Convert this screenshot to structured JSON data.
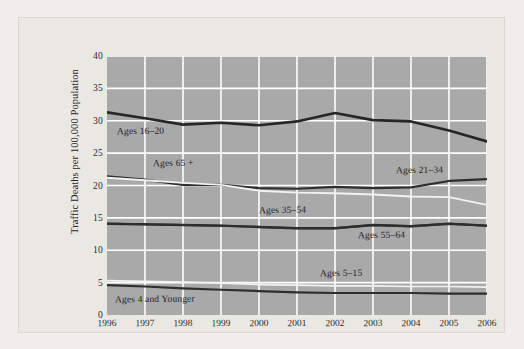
{
  "chart_data": {
    "type": "line",
    "title": "",
    "xlabel": "",
    "ylabel": "Traffic Deaths per 100,000 Population",
    "categories": [
      1996,
      1997,
      1998,
      1999,
      2000,
      2001,
      2002,
      2003,
      2004,
      2005,
      2006
    ],
    "x_tick_labels": [
      "1996",
      "1997",
      "1998",
      "1999",
      "2000",
      "2001",
      "2002",
      "2003",
      "2004",
      "2005",
      "2006"
    ],
    "y_tick_labels": [
      "0",
      "5",
      "10",
      "15",
      "20",
      "25",
      "30",
      "35",
      "40"
    ],
    "y_ticks": [
      0,
      5,
      10,
      15,
      20,
      25,
      30,
      35,
      40
    ],
    "ylim": [
      0,
      40
    ],
    "xlim": [
      1996,
      2006
    ],
    "grid": true,
    "legend_position": "inline-labels",
    "plot_background": "#a9a9a9",
    "gridline_color": "#ffffff",
    "series": [
      {
        "name": "Ages 16–20",
        "label": "Ages 16–20",
        "color": "#262626",
        "style": "dark",
        "width": 2.6,
        "values": [
          31.3,
          30.4,
          29.4,
          29.7,
          29.3,
          29.9,
          31.2,
          30.1,
          29.9,
          28.5,
          26.8
        ],
        "label_x": 1996.25,
        "label_y": 28.2
      },
      {
        "name": "Ages 21–34",
        "label": "Ages 21–34",
        "color": "#2e2e2e",
        "style": "dark",
        "width": 2.2,
        "values": [
          21.4,
          20.9,
          20.1,
          20.1,
          19.6,
          19.5,
          19.8,
          19.6,
          19.7,
          20.7,
          21.0
        ],
        "label_x": 2003.6,
        "label_y": 22.3
      },
      {
        "name": "Ages 65 +",
        "label": "Ages 65 +",
        "color": "#f2f2f2",
        "style": "light",
        "width": 1.9,
        "values": [
          21.2,
          20.8,
          20.4,
          20.1,
          19.2,
          18.9,
          18.8,
          18.6,
          18.3,
          18.2,
          17.0
        ],
        "label_x": 1997.2,
        "label_y": 23.3
      },
      {
        "name": "Ages 35–54",
        "label": "Ages 35–54",
        "color": "#2e2e2e",
        "style": "dark",
        "width": 2.4,
        "values": [
          14.1,
          14.0,
          13.9,
          13.8,
          13.6,
          13.4,
          13.4,
          13.9,
          13.7,
          14.1,
          13.8
        ],
        "label_x": 2000.0,
        "label_y": 16.0
      },
      {
        "name": "Ages 55–64",
        "label": "Ages 55–64",
        "color": "#2e2e2e",
        "style": "dark",
        "width": 2.0,
        "values": [
          14.1,
          14.0,
          13.9,
          13.8,
          13.6,
          13.4,
          13.4,
          13.9,
          13.7,
          14.1,
          13.8
        ],
        "label_x": 2002.6,
        "label_y": 12.2
      },
      {
        "name": "Ages 5–15",
        "label": "Ages 5–15",
        "color": "#f2f2f2",
        "style": "light",
        "width": 1.7,
        "values": [
          5.3,
          5.2,
          5.1,
          4.9,
          4.7,
          4.6,
          4.5,
          4.5,
          4.4,
          4.4,
          4.3
        ],
        "label_x": 2001.6,
        "label_y": 6.3
      },
      {
        "name": "Ages 4 and Younger",
        "label": "Ages 4 and Younger",
        "color": "#2e2e2e",
        "style": "dark",
        "width": 2.2,
        "values": [
          4.6,
          4.4,
          4.1,
          3.9,
          3.7,
          3.5,
          3.4,
          3.4,
          3.4,
          3.3,
          3.3
        ],
        "label_x": 1996.2,
        "label_y": 2.3
      }
    ]
  }
}
